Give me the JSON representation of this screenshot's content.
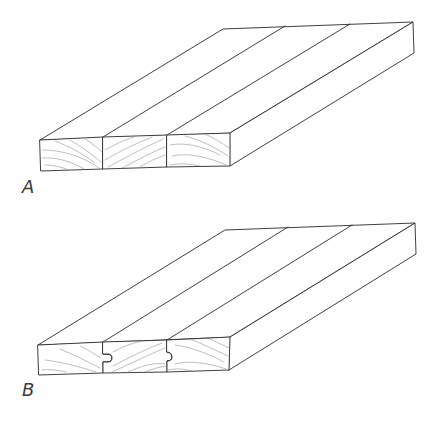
{
  "figure": {
    "panels": [
      {
        "id": "A",
        "label": "A",
        "joint_type": "square-edged",
        "board_count": 3
      },
      {
        "id": "B",
        "label": "B",
        "joint_type": "tongue-and-groove",
        "board_count": 3
      }
    ]
  },
  "colors": {
    "background": "#ffffff",
    "line": "#2a2a2a",
    "grain": "#8a8a8a"
  }
}
